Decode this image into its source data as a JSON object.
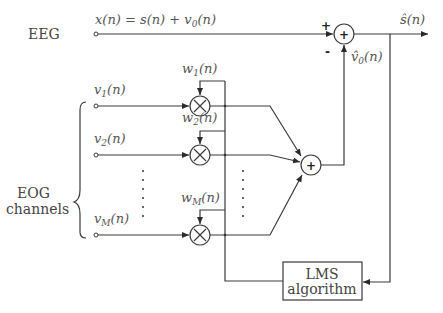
{
  "diagram": {
    "labels": {
      "eeg": "EEG",
      "eog_line1": "EOG",
      "eog_line2": "channels",
      "eeg_signal": "x(n) = s(n) + v₀(n)",
      "output": "ŝ(n)",
      "estimate": "v̂₀(n)",
      "lms_line1": "LMS",
      "lms_line2": "algorithm"
    },
    "inputs": [
      {
        "name": "v",
        "sub": "1",
        "text": "v₁(n)"
      },
      {
        "name": "v",
        "sub": "2",
        "text": "v₂(n)"
      },
      {
        "name": "v",
        "sub": "M",
        "text": "v_M(n)"
      }
    ],
    "weights": [
      {
        "name": "w",
        "sub": "1",
        "text": "w₁(n)"
      },
      {
        "name": "w",
        "sub": "2",
        "text": "w₂(n)"
      },
      {
        "name": "w",
        "sub": "M",
        "text": "w_M(n)"
      }
    ],
    "summer_main": {
      "symbol": "+",
      "plus_sign": "+",
      "minus_sign": "-"
    },
    "summer_inner": {
      "symbol": "+"
    },
    "multiplier_symbol": "×",
    "colors": {
      "line": "#3a3a3a",
      "text": "#444444",
      "background": "#ffffff"
    }
  }
}
